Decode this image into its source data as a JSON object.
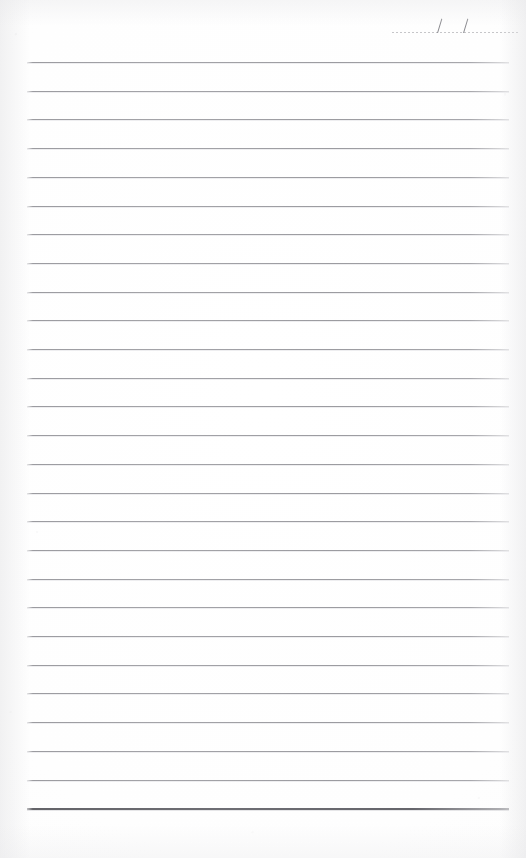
{
  "document": {
    "type": "lined-notebook-page",
    "title": "Blank lined notebook page",
    "page_width": 526,
    "page_height": 858,
    "background_color": "#fefefe",
    "paper_tone": "#ffffff"
  },
  "date_field": {
    "label": "",
    "value": "",
    "placeholder": "",
    "separator_glyph": "/",
    "separator_count": 2,
    "slash_positions_px": [
      45,
      71
    ],
    "rule_style": "dotted",
    "rule_color": "#c3c3c6",
    "slash_color": "#8b8b90",
    "left_px": 392,
    "top_px": 14,
    "width_px": 126,
    "segments": [
      "",
      "",
      ""
    ]
  },
  "ruled_lines": {
    "count": 27,
    "first_line_y": 62,
    "spacing_px": 28.7,
    "left_margin_px": 27,
    "right_margin_px": 509,
    "line_color": "#9a9a9f",
    "line_thickness_px": 1,
    "emphasis": {
      "index": 26,
      "label": "bottom-border-rule",
      "thickness_px": 2,
      "color": "#646469"
    },
    "content": [
      "",
      "",
      "",
      "",
      "",
      "",
      "",
      "",
      "",
      "",
      "",
      "",
      "",
      "",
      "",
      "",
      "",
      "",
      "",
      "",
      "",
      "",
      "",
      "",
      "",
      "",
      ""
    ]
  },
  "margins": {
    "top_blank_px": 62,
    "bottom_blank_px": 48,
    "left_blank_px": 27,
    "right_blank_px": 17
  },
  "writing_area": {
    "text": "",
    "placeholder": ""
  }
}
